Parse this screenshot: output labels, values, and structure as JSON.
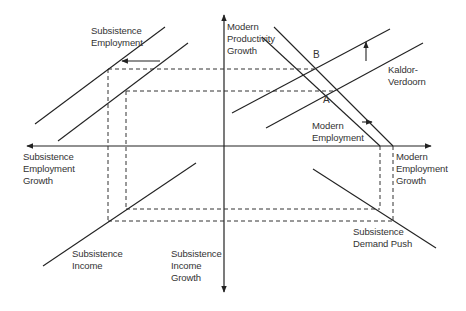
{
  "diagram": {
    "title": "",
    "axes": {
      "vertical_up": "Modern\nProductivity\nGrowth",
      "vertical_down": "Subsistence\nIncome\nGrowth",
      "horizontal_left": "Subsistence\nEmployment\nGrowth",
      "horizontal_right": "Modern\nEmployment\nGrowth"
    },
    "curves": {
      "subsistence_employment": "Subsistence\nEmployment",
      "kaldor_verdoorn": "Kaldor-\nVerdoorn",
      "modern_employment": "Modern\nEmployment",
      "subsistence_income": "Subsistence\nIncome",
      "subsistence_demand_push": "Subsistence\nDemand Push"
    },
    "points": {
      "a": "A",
      "b": "B"
    },
    "colors": {
      "line": "#222222",
      "text": "#333333",
      "background": "#ffffff"
    }
  }
}
